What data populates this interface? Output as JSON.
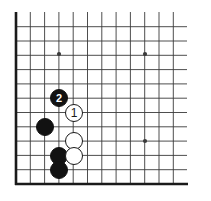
{
  "diagram": {
    "type": "go-board-position",
    "board": {
      "background_color": "#ffffff",
      "line_color": "#3a3a3a",
      "border_color": "#1a1a1a",
      "grid_spacing": 14.3,
      "origin_x": 16,
      "origin_y": 12,
      "columns": 13,
      "rows": 12,
      "left_edge_x": 16,
      "bottom_edge_y": 184,
      "right_edge_x": 187,
      "top_edge_y": 19
    },
    "star_points": [
      {
        "name": "star-point-upper-left",
        "x": 59,
        "y": 54
      },
      {
        "name": "star-point-upper-right",
        "x": 145,
        "y": 54
      },
      {
        "name": "star-point-lower-right",
        "x": 145,
        "y": 141
      }
    ],
    "stones": [
      {
        "name": "stone-black-move-2",
        "color": "black",
        "label": "2",
        "x": 59,
        "y": 98,
        "radius": 9
      },
      {
        "name": "stone-white-move-1",
        "color": "white",
        "label": "1",
        "x": 74,
        "y": 113,
        "radius": 9
      },
      {
        "name": "stone-black-left",
        "color": "black",
        "label": "",
        "x": 45,
        "y": 127,
        "radius": 9
      },
      {
        "name": "stone-white-upper",
        "color": "white",
        "label": "",
        "x": 74,
        "y": 141,
        "radius": 9
      },
      {
        "name": "stone-black-middle",
        "color": "black",
        "label": "",
        "x": 59,
        "y": 156,
        "radius": 9
      },
      {
        "name": "stone-white-lower",
        "color": "white",
        "label": "",
        "x": 74,
        "y": 156,
        "radius": 9
      },
      {
        "name": "stone-black-bottom",
        "color": "black",
        "label": "",
        "x": 59,
        "y": 170,
        "radius": 9
      }
    ],
    "colors": {
      "black_stone": "#121212",
      "white_stone": "#ffffff",
      "stone_outline": "#1a1a1a",
      "grid": "#3a3a3a",
      "black_label_text": "#ffffff",
      "white_label_text": "#1a1a1a"
    }
  }
}
